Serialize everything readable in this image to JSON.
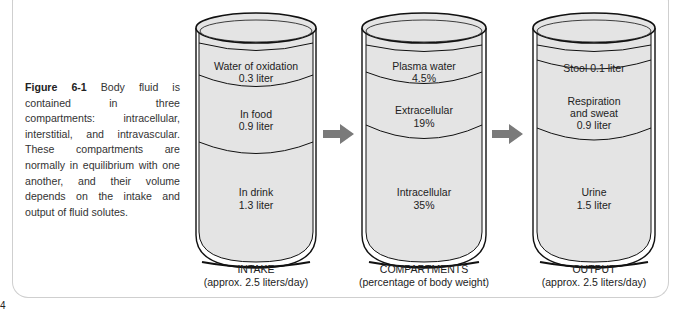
{
  "caption": {
    "figure_label": "Figure 6-1",
    "text": " Body fluid is contained in three compartments: intracellular, interstitial, and intravascular. These compartments are normally in equilibrium with one another, and their volume depends on the intake and output of fluid solutes."
  },
  "page_number": "4",
  "containers": [
    {
      "id": "intake",
      "title": "INTAKE",
      "subtitle": "(approx. 2.5 liters/day)",
      "layers": [
        {
          "name": "Water of oxidation",
          "value": "0.3 liter"
        },
        {
          "name": "In food",
          "value": "0.9 liter"
        },
        {
          "name": "In drink",
          "value": "1.3 liter"
        }
      ]
    },
    {
      "id": "compartments",
      "title": "COMPARTMENTS",
      "subtitle": "(percentage of body weight)",
      "layers": [
        {
          "name": "Plasma water",
          "value": "4.5%"
        },
        {
          "name": "Extracellular",
          "value": "19%"
        },
        {
          "name": "Intracellular",
          "value": "35%"
        }
      ]
    },
    {
      "id": "output",
      "title": "OUTPUT",
      "subtitle": "(approx. 2.5 liters/day)",
      "layers": [
        {
          "name": "Stool 0.1 liter",
          "value": ""
        },
        {
          "name": "Respiration",
          "value": "and sweat",
          "value2": "0.9 liter"
        },
        {
          "name": "Urine",
          "value": "1.5 liter"
        }
      ]
    }
  ],
  "arrows": [
    {
      "from": "intake",
      "to": "compartments",
      "icon": "right-arrow-icon"
    },
    {
      "from": "compartments",
      "to": "output",
      "icon": "right-arrow-icon"
    }
  ],
  "colors": {
    "fluid": "#e4e4e4",
    "stroke": "#111111",
    "arrow": "#7a7a7a",
    "frame": "#cfcfcf"
  }
}
